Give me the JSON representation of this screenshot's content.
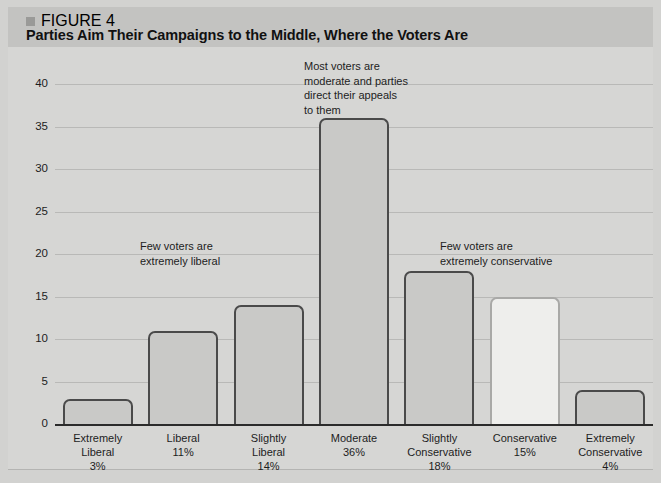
{
  "figure": {
    "label": "FIGURE 4",
    "title": "Parties Aim Their Campaigns to the Middle, Where the Voters Are"
  },
  "chart_data": {
    "type": "bar",
    "title": "Parties Aim Their Campaigns to the Middle, Where the Voters Are",
    "xlabel": "",
    "ylabel": "",
    "ylim": [
      0,
      42
    ],
    "grid": true,
    "legend": "none",
    "categories": [
      "Extremely Liberal",
      "Liberal",
      "Slightly Liberal",
      "Moderate",
      "Slightly Conservative",
      "Conservative",
      "Extremely Conservative"
    ],
    "values": [
      3,
      11,
      14,
      36,
      18,
      15,
      4
    ],
    "value_labels": [
      "3%",
      "11%",
      "14%",
      "36%",
      "18%",
      "15%",
      "4%"
    ],
    "yticks": [
      0,
      5,
      10,
      15,
      20,
      25,
      30,
      35,
      40
    ],
    "ytick_labels": [
      "0",
      "5",
      "10",
      "15",
      "20",
      "25",
      "30",
      "35",
      "40"
    ],
    "bar_styles": [
      "mid",
      "mid",
      "mid",
      "mid",
      "mid",
      "light",
      "mid"
    ],
    "annotations": [
      {
        "id": "left",
        "text": "Few voters are\nextremely liberal"
      },
      {
        "id": "center",
        "text": "Most voters are\nmoderate and parties\ndirect their appeals\nto them"
      },
      {
        "id": "right",
        "text": "Few voters are\nextremely conservative"
      }
    ]
  },
  "x_labels": [
    {
      "line1": "Extremely",
      "line2": "Liberal",
      "line3": "3%"
    },
    {
      "line1": "Liberal",
      "line2": "11%",
      "line3": ""
    },
    {
      "line1": "Slightly",
      "line2": "Liberal",
      "line3": "14%"
    },
    {
      "line1": "Moderate",
      "line2": "36%",
      "line3": ""
    },
    {
      "line1": "Slightly",
      "line2": "Conservative",
      "line3": "18%"
    },
    {
      "line1": "Conservative",
      "line2": "15%",
      "line3": ""
    },
    {
      "line1": "Extremely",
      "line2": "Conservative",
      "line3": "4%"
    }
  ],
  "colors": {
    "page_background": "#d2d2d0",
    "header_band": "#c3c3c1",
    "plot_background": "#d6d6d4",
    "gridline": "#b9b9b7",
    "axis": "#2b2b2b",
    "bar_fill": "#c9c9c7",
    "bar_outline": "#4a4a4a",
    "bar_fill_highlight": "#eeeeec",
    "bar_outline_highlight": "#a9a9a7",
    "text": "#1d1d1d"
  }
}
